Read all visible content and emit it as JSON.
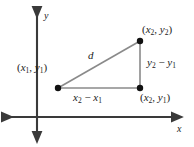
{
  "figure": {
    "background_color": "#ffffff",
    "axis_color": "#3a3a3a",
    "triangle_color": "#8a8a8a",
    "point_color": "#111111",
    "text_color": "#1a1a1a"
  },
  "axes": {
    "y_label": "y",
    "x_label": "x",
    "origin": {
      "x": 37,
      "y": 117
    }
  },
  "points": [
    {
      "name": "point-1",
      "label_parts": {
        "open": "(",
        "x_var": "x",
        "x_sub": "1",
        "comma": ", ",
        "y_var": "y",
        "y_sub": "1",
        "close": ")"
      },
      "label_text": "(x1, y1)",
      "cx": 58,
      "cy": 88
    },
    {
      "name": "point-2",
      "label_parts": {
        "open": "(",
        "x_var": "x",
        "x_sub": "2",
        "comma": ", ",
        "y_var": "y",
        "y_sub": "2",
        "close": ")"
      },
      "label_text": "(x2, y2)",
      "cx": 140,
      "cy": 41
    },
    {
      "name": "point-3",
      "label_parts": {
        "open": "(",
        "x_var": "x",
        "x_sub": "2",
        "comma": ", ",
        "y_var": "y",
        "y_sub": "1",
        "close": ")"
      },
      "label_text": "(x2, y1)",
      "cx": 140,
      "cy": 88
    }
  ],
  "legs": {
    "vertical": {
      "name": "vertical-leg-label",
      "parts": {
        "a_var": "y",
        "a_sub": "2",
        "op": " − ",
        "b_var": "y",
        "b_sub": "1"
      },
      "text": "y2 - y1"
    },
    "horizontal": {
      "name": "horizontal-leg-label",
      "parts": {
        "a_var": "x",
        "a_sub": "2",
        "op": " − ",
        "b_var": "x",
        "b_sub": "1"
      },
      "text": "x2 - x1"
    },
    "hypotenuse": {
      "name": "distance-label",
      "text": "d"
    }
  }
}
